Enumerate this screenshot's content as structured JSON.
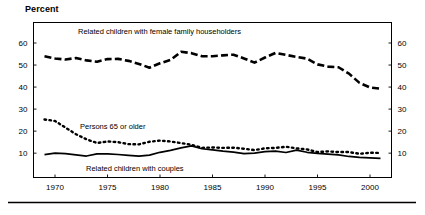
{
  "title": "Percent",
  "chart_data": {
    "type": "line",
    "title": "Percent",
    "xlabel": "",
    "ylabel": "Percent",
    "xlim": [
      1969,
      2001
    ],
    "ylim": [
      0,
      65
    ],
    "grid": false,
    "legend_position": "inline-annotations",
    "x_ticks": [
      1970,
      1975,
      1980,
      1985,
      1990,
      1995,
      2000
    ],
    "y_ticks": [
      10,
      20,
      30,
      40,
      50,
      60
    ],
    "y_axis_right_ticks": [
      10,
      20,
      30,
      40,
      50,
      60
    ],
    "x": [
      1969,
      1970,
      1971,
      1972,
      1973,
      1974,
      1975,
      1976,
      1977,
      1978,
      1979,
      1980,
      1981,
      1982,
      1983,
      1984,
      1985,
      1986,
      1987,
      1988,
      1989,
      1990,
      1991,
      1992,
      1993,
      1994,
      1995,
      1996,
      1997,
      1998,
      1999,
      2000,
      2001
    ],
    "series": [
      {
        "name": "Related children with female family householders",
        "style": "dashed",
        "annotation": "Related children with female family householders",
        "values": [
          54.0,
          53.0,
          52.5,
          53.2,
          52.1,
          51.5,
          52.7,
          52.8,
          51.9,
          50.5,
          48.8,
          50.8,
          52.3,
          56.0,
          55.4,
          54.0,
          54.0,
          54.4,
          54.7,
          53.0,
          51.1,
          53.4,
          55.5,
          54.6,
          53.7,
          52.9,
          50.3,
          49.3,
          49.0,
          46.1,
          41.9,
          39.8,
          39.3
        ]
      },
      {
        "name": "Persons 65 or older",
        "style": "dotted",
        "annotation": "Persons 65 or older",
        "values": [
          25.3,
          24.6,
          21.6,
          18.6,
          16.3,
          14.6,
          15.3,
          15.0,
          14.1,
          14.0,
          15.2,
          15.7,
          15.3,
          14.6,
          13.8,
          12.4,
          12.6,
          12.4,
          12.5,
          12.0,
          11.4,
          12.2,
          12.4,
          12.9,
          12.2,
          11.7,
          10.5,
          10.8,
          10.5,
          10.5,
          9.7,
          10.2,
          10.1
        ]
      },
      {
        "name": "Related children with couples",
        "style": "solid",
        "annotation": "Related children with couples",
        "values": [
          9.3,
          10.0,
          9.8,
          9.2,
          8.7,
          9.7,
          9.7,
          9.4,
          9.0,
          8.7,
          9.1,
          10.4,
          11.3,
          12.4,
          13.3,
          12.0,
          11.5,
          10.9,
          10.5,
          9.8,
          10.0,
          10.7,
          10.9,
          10.3,
          11.4,
          10.4,
          9.9,
          9.6,
          9.2,
          8.5,
          8.1,
          7.9,
          7.6
        ]
      }
    ],
    "annotations": [
      {
        "text": "Related children with female family householders",
        "x_px": 78,
        "y_px": 34
      },
      {
        "text": "Persons 65 or older",
        "x_px": 80,
        "y_px": 129
      },
      {
        "text": "Related children with couples",
        "x_px": 86,
        "y_px": 171
      }
    ]
  }
}
